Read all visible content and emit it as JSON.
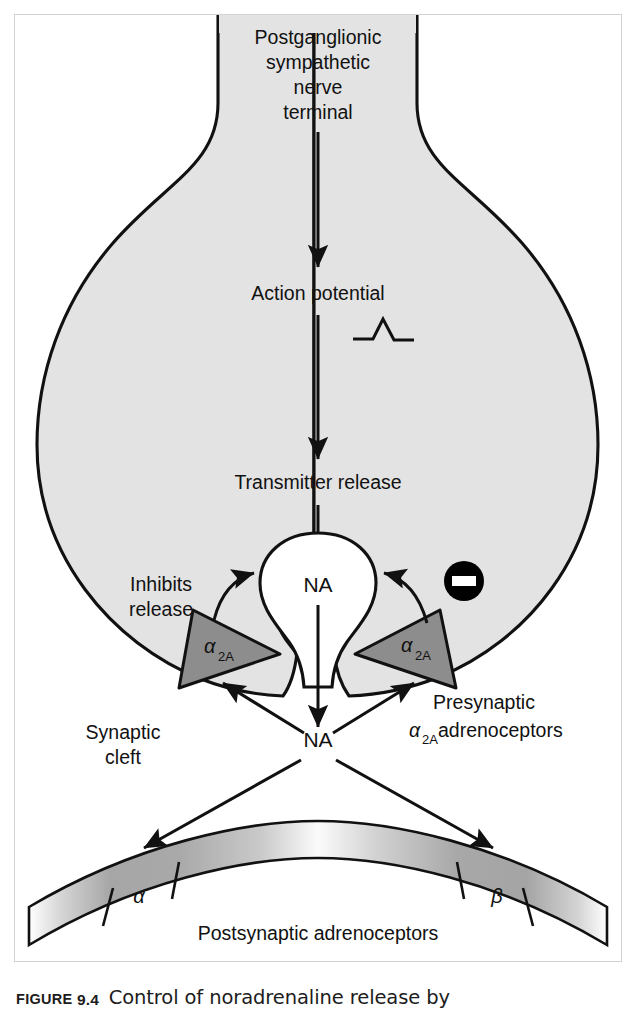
{
  "caption": {
    "figure_word": "FIGURE",
    "figure_number": "9.4",
    "text": "Control of noradrenaline release by"
  },
  "diagram": {
    "terminal_label": {
      "line1": "Postganglionic",
      "line2": "sympathetic",
      "line3": "nerve",
      "line4": "terminal"
    },
    "action_potential_label": "Action potential",
    "transmitter_release_label": "Transmitter release",
    "vesicle_label": "NA",
    "cleft_transmitter_label": "NA",
    "inhibits_release_label": {
      "line1": "Inhibits",
      "line2": "release"
    },
    "synaptic_cleft_label": {
      "line1": "Synaptic",
      "line2": "cleft"
    },
    "presynaptic_label": {
      "line1": "Presynaptic",
      "line2_alpha": "α",
      "line2_sub": "2A",
      "line2_rest": " adrenoceptors"
    },
    "receptor_alpha2a_left": {
      "symbol": "α",
      "subscript": "2A"
    },
    "receptor_alpha2a_right": {
      "symbol": "α",
      "subscript": "2A"
    },
    "inhibition_badge": "−",
    "postsynaptic_label": "Postsynaptic adrenoceptors",
    "postsynaptic_receptor_alpha": "α",
    "postsynaptic_receptor_beta": "β",
    "colors": {
      "terminal_fill": "#e3e3e3",
      "terminal_stroke": "#111111",
      "vesicle_fill": "#ffffff",
      "receptor_fill": "#8d8d8d",
      "receptor_stroke": "#111111",
      "badge_fill": "#000000",
      "badge_mark": "#ffffff",
      "membrane_light": "#f4f4f4",
      "membrane_dark": "#9b9b9b",
      "arrow": "#111111",
      "frame": "#d2d2d2",
      "text": "#111111"
    }
  }
}
